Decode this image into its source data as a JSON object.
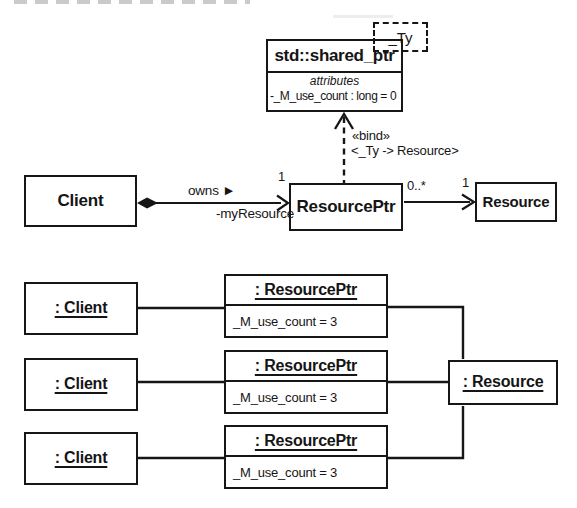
{
  "class_diagram": {
    "shared_ptr": {
      "template_param": "_Ty",
      "name": "std::shared_ptr",
      "attributes_label": "attributes",
      "attribute": "-_M_use_count : long = 0"
    },
    "bind": {
      "stereotype": "«bind»",
      "binding": "<_Ty -> Resource>"
    },
    "client": {
      "name": "Client"
    },
    "resource_ptr": {
      "name": "ResourcePtr"
    },
    "resource": {
      "name": "Resource"
    },
    "owns": {
      "label": "owns ►",
      "role": "-myResource",
      "multiplicity": "1"
    },
    "points_to": {
      "multiplicity_source": "0..*",
      "multiplicity_target": "1"
    }
  },
  "object_diagram": {
    "clients": [
      {
        "name": ": Client"
      },
      {
        "name": ": Client"
      },
      {
        "name": ": Client"
      }
    ],
    "resource_ptrs": [
      {
        "name": ": ResourcePtr",
        "slot": "_M_use_count = 3"
      },
      {
        "name": ": ResourcePtr",
        "slot": "_M_use_count = 3"
      },
      {
        "name": ": ResourcePtr",
        "slot": "_M_use_count = 3"
      }
    ],
    "resource": {
      "name": ": Resource"
    }
  }
}
